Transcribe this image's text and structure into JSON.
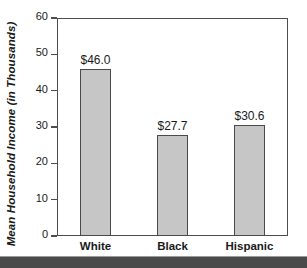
{
  "chart_data": {
    "type": "bar",
    "title": "",
    "xlabel": "",
    "ylabel": "Mean Household Income (in Thousands)",
    "categories": [
      "White",
      "Black",
      "Hispanic"
    ],
    "values": [
      46.0,
      27.7,
      30.6
    ],
    "value_labels": [
      "$46.0",
      "$27.7",
      "$30.6"
    ],
    "ylim": [
      0,
      60
    ],
    "yticks": [
      0,
      10,
      20,
      30,
      40,
      50,
      60
    ],
    "ytick_labels": [
      "0",
      "10",
      "20",
      "30",
      "40",
      "50",
      "60"
    ],
    "grid": false,
    "legend": "none",
    "bar_fill_color": "#c6c6c6",
    "bar_border_color": "#4a4a4a",
    "frame_color": "#4d4d4d",
    "text_color": "#1a1a1a",
    "background_color": "#ffffff",
    "band_color": "#4a4a4a"
  },
  "axis": {
    "y_title": "Mean Household Income (in Thousands)",
    "ticks": [
      {
        "label": "60"
      },
      {
        "label": "50"
      },
      {
        "label": "40"
      },
      {
        "label": "30"
      },
      {
        "label": "20"
      },
      {
        "label": "10"
      },
      {
        "label": "0"
      }
    ]
  },
  "bars": [
    {
      "category": "White",
      "value_label": "$46.0"
    },
    {
      "category": "Black",
      "value_label": "$27.7"
    },
    {
      "category": "Hispanic",
      "value_label": "$30.6"
    }
  ]
}
